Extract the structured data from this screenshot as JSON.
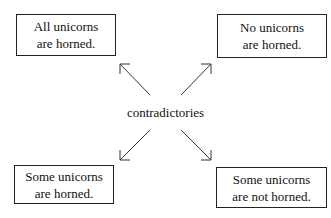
{
  "diagram": {
    "center_label": "contradictories",
    "boxes": [
      {
        "id": "top-left",
        "line1": "All unicorns",
        "line2": "are horned."
      },
      {
        "id": "top-right",
        "line1": "No unicorns",
        "line2": "are horned."
      },
      {
        "id": "bottom-left",
        "line1": "Some unicorns",
        "line2": "are horned."
      },
      {
        "id": "bottom-right",
        "line1": "Some unicorns",
        "line2": "are not horned."
      }
    ],
    "arrows": [
      {
        "from": "center",
        "to": "top-left"
      },
      {
        "from": "center",
        "to": "top-right"
      },
      {
        "from": "center",
        "to": "bottom-left"
      },
      {
        "from": "center",
        "to": "bottom-right"
      }
    ],
    "colors": {
      "stroke": "#222222",
      "background": "#ffffff"
    }
  }
}
